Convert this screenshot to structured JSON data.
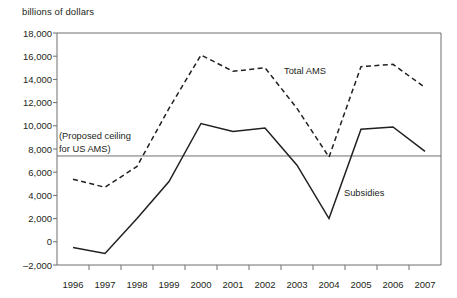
{
  "chart_data": {
    "type": "line",
    "title": "billions of dollars",
    "xlabel": "",
    "ylabel": "billions of dollars",
    "x": [
      "1996",
      "1997",
      "1998",
      "1999",
      "2000",
      "2001",
      "2002",
      "2003",
      "2004",
      "2005",
      "2006",
      "2007"
    ],
    "categories": [
      "1996",
      "1997",
      "1998",
      "1999",
      "2000",
      "2001",
      "2002",
      "2003",
      "2004",
      "2005",
      "2006",
      "2007"
    ],
    "series": [
      {
        "name": "Total AMS",
        "style": "dashed",
        "color": "#231f20",
        "values": [
          5400,
          4700,
          6500,
          11500,
          16100,
          14700,
          15000,
          11500,
          7300,
          15100,
          15300,
          13300
        ]
      },
      {
        "name": "Subsidies",
        "style": "solid",
        "color": "#231f20",
        "values": [
          -500,
          -1000,
          2000,
          5200,
          10200,
          9500,
          9800,
          6600,
          2000,
          9700,
          9900,
          7800
        ]
      }
    ],
    "reference_lines": [
      {
        "name": "proposed-ceiling",
        "label": "(Proposed ceiling for US AMS)",
        "label_line1": "(Proposed ceiling",
        "label_line2": "for US AMS)",
        "value": 7400,
        "color": "#6d6e71"
      }
    ],
    "ylim": [
      -2000,
      18000
    ],
    "yticks": [
      18000,
      16000,
      14000,
      12000,
      10000,
      8000,
      6000,
      4000,
      2000,
      0,
      -2000
    ],
    "ytick_labels": [
      "18,000",
      "16,000",
      "14,000",
      "12,000",
      "10,000",
      "8,000",
      "6,000",
      "4,000",
      "2,000",
      "0",
      "–2,000"
    ],
    "grid": false,
    "legend": "inline-annotations",
    "annotations": [
      {
        "name": "total-ams-label",
        "text": "Total AMS"
      },
      {
        "name": "subsidies-label",
        "text": "Subsidies"
      }
    ]
  },
  "axes": {
    "y_axis_name": "y-axis",
    "x_axis_name": "x-axis"
  }
}
